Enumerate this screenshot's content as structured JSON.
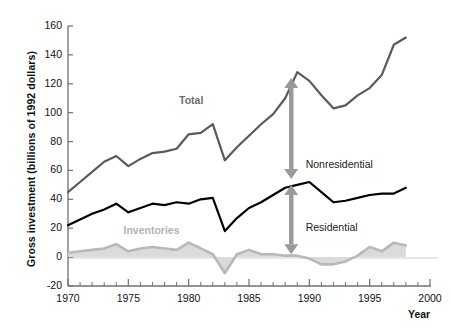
{
  "chart_data": {
    "type": "line",
    "title": "",
    "subtitle": "",
    "xlabel": "Year",
    "ylabel": "Gross investment (billions of 1992 dollars)",
    "xlim": [
      1970,
      2000
    ],
    "ylim": [
      -20,
      160
    ],
    "xticks_major": [
      1970,
      1975,
      1980,
      1985,
      1990,
      1995,
      2000
    ],
    "xticks_minor_step": 1,
    "yticks": [
      -20,
      0,
      20,
      40,
      60,
      80,
      100,
      120,
      140,
      160
    ],
    "grid": false,
    "legend_position": "inline-annotations",
    "zero_line": true,
    "x": [
      1970,
      1971,
      1972,
      1973,
      1974,
      1975,
      1976,
      1977,
      1978,
      1979,
      1980,
      1981,
      1982,
      1983,
      1984,
      1985,
      1986,
      1987,
      1988,
      1989,
      1990,
      1991,
      1992,
      1993,
      1994,
      1995,
      1996,
      1997,
      1998
    ],
    "series": [
      {
        "name": "Total",
        "color": "#5a5a5a",
        "style": "line",
        "values": [
          45,
          52,
          59,
          66,
          70,
          63,
          68,
          72,
          73,
          75,
          85,
          86,
          92,
          67,
          76,
          84,
          92,
          99,
          110,
          128,
          122,
          112,
          103,
          105,
          112,
          117,
          126,
          147,
          152
        ]
      },
      {
        "name": "Residential",
        "color": "#000000",
        "style": "line",
        "values": [
          22,
          26,
          30,
          33,
          37,
          31,
          34,
          37,
          36,
          38,
          37,
          40,
          41,
          18,
          27,
          34,
          38,
          43,
          48,
          50,
          52,
          45,
          38,
          39,
          41,
          43,
          44,
          44,
          48
        ]
      },
      {
        "name": "Inventories",
        "color": "#b8b8b8",
        "style": "area",
        "values": [
          3,
          4,
          5,
          6,
          9,
          4,
          6,
          7,
          6,
          5,
          10,
          6,
          2,
          -11,
          2,
          5,
          2,
          2,
          1,
          1,
          -1,
          -5,
          -5,
          -3,
          1,
          7,
          4,
          10,
          8
        ]
      }
    ],
    "annotations": [
      {
        "name": "total-label",
        "text": "Total",
        "x": 1979.2,
        "y": 108,
        "color": "#6e6e6e",
        "bold": true
      },
      {
        "name": "inventories-label",
        "text": "Inventories",
        "x": 1974.6,
        "y": 18,
        "color": "#b3b3b3",
        "bold": true
      },
      {
        "name": "nonresidential-label",
        "text": "Nonresidential",
        "x": 1989.7,
        "y": 64,
        "color": "#1a1a1a",
        "bold": false
      },
      {
        "name": "residential-label",
        "text": "Residential",
        "x": 1989.7,
        "y": 20,
        "color": "#1a1a1a",
        "bold": false
      }
    ],
    "arrows": [
      {
        "name": "nonresidential-arrow",
        "x": 1988.5,
        "y_top": 124,
        "y_bottom": 54,
        "color": "#9a9a9a",
        "double_headed": true
      },
      {
        "name": "residential-arrow",
        "x": 1988.5,
        "y_top": 50,
        "y_bottom": 2,
        "color": "#9a9a9a",
        "double_headed": true
      }
    ]
  },
  "colors": {
    "total": "#5a5a5a",
    "residential": "#000000",
    "inventories_line": "#b8b8b8",
    "inventories_fill": "#d9d9d9",
    "arrow": "#9a9a9a",
    "axis": "#6f6f6f",
    "text": "#111111",
    "background": "#ffffff"
  }
}
